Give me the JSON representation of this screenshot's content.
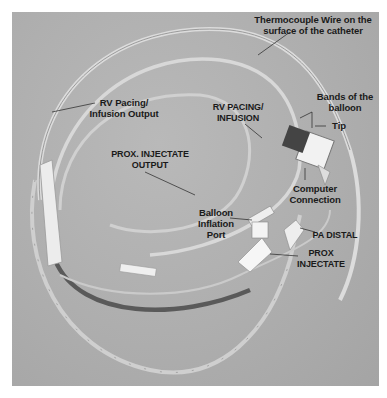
{
  "figure": {
    "colors": {
      "background": "#ffffff",
      "photo": "#b0b0b0",
      "tube_light": "#dedede",
      "tube_dark": "#5a5a5a",
      "text": "#1a1a1a"
    },
    "labels": [
      {
        "id": "thermocouple",
        "text": "Thermocouple Wire on the\nsurface of the catheter"
      },
      {
        "id": "bands",
        "text": "Bands of the\nballoon"
      },
      {
        "id": "tip",
        "text": "Tip"
      },
      {
        "id": "rv-pacing-output",
        "text": "RV Pacing/\nInfusion Output"
      },
      {
        "id": "rv-pacing-infusion",
        "text": "RV PACING/\nINFUSION"
      },
      {
        "id": "prox-injectate-output",
        "text": "PROX. INJECTATE\nOUTPUT"
      },
      {
        "id": "computer-connection",
        "text": "Computer\nConnection"
      },
      {
        "id": "balloon-inflation-port",
        "text": "Balloon\nInflation\nPort"
      },
      {
        "id": "pa-distal",
        "text": "PA DISTAL"
      },
      {
        "id": "prox-injectate",
        "text": "PROX\nINJECTATE"
      }
    ]
  }
}
